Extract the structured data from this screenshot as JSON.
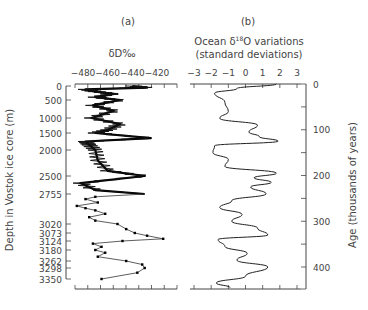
{
  "chart_data": [
    {
      "type": "line",
      "panel_label": "(a)",
      "title": "δD‰",
      "xlabel": "δD‰",
      "ylabel": "Depth in Vostok ice core (m)",
      "x_ticks": [
        "−480",
        "−460",
        "−440",
        "−420"
      ],
      "xlim": [
        -490,
        -410
      ],
      "y_ticks": [
        "0",
        "500",
        "1000",
        "1500",
        "2000",
        "2500",
        "2755",
        "3020",
        "3073",
        "3124",
        "3180",
        "3262",
        "3298",
        "3350"
      ],
      "y_inverted": true,
      "series": [
        {
          "name": "Vostok δD (continuous)",
          "depth": [
            0,
            60,
            120,
            200,
            280,
            400,
            500,
            650,
            800,
            1000,
            1200,
            1400,
            1500,
            1650,
            1750,
            1850,
            2000,
            2200,
            2400,
            2500,
            2600,
            2700,
            2755
          ],
          "values": [
            -440,
            -428,
            -478,
            -470,
            -455,
            -470,
            -450,
            -472,
            -455,
            -473,
            -450,
            -460,
            -470,
            -425,
            -478,
            -475,
            -470,
            -468,
            -460,
            -430,
            -482,
            -470,
            -430
          ]
        },
        {
          "name": "Vostok δD (deep, discrete points)",
          "depth": [
            2780,
            2800,
            2830,
            2860,
            2880,
            2900,
            2930,
            2960,
            2990,
            3020,
            3050,
            3073,
            3090,
            3110,
            3124,
            3140,
            3160,
            3180,
            3200,
            3230,
            3262,
            3280,
            3298,
            3320,
            3350
          ],
          "values": [
            -470,
            -478,
            -468,
            -485,
            -478,
            -470,
            -462,
            -475,
            -470,
            -452,
            -445,
            -438,
            -428,
            -415,
            -448,
            -472,
            -465,
            -470,
            -462,
            -468,
            -445,
            -432,
            -430,
            -436,
            -465
          ]
        }
      ]
    },
    {
      "type": "line",
      "panel_label": "(b)",
      "title": "Ocean δ18O variations (standard deviations)",
      "xlabel": "Ocean δ18O variations (standard deviations)",
      "ylabel": "Age (thousands of years)",
      "x_ticks": [
        "−3",
        "−2",
        "−1",
        "0",
        "1",
        "2",
        "3"
      ],
      "xlim": [
        -3,
        3
      ],
      "y_ticks": [
        "0",
        "100",
        "200",
        "300",
        "400"
      ],
      "ylim": [
        0,
        450
      ],
      "y_inverted": true,
      "series": [
        {
          "name": "Ocean δ18O",
          "age": [
            0,
            10,
            20,
            40,
            60,
            75,
            90,
            105,
            115,
            125,
            135,
            150,
            165,
            180,
            195,
            205,
            215,
            225,
            240,
            255,
            270,
            285,
            300,
            315,
            330,
            340,
            355,
            370,
            385,
            400,
            420,
            435,
            445
          ],
          "values": [
            1.8,
            -0.5,
            -1.8,
            -1.2,
            -1.0,
            -1.5,
            0.7,
            0.2,
            0.8,
            1.9,
            -1.8,
            -1.9,
            -1.0,
            -1.2,
            1.8,
            0.5,
            1.5,
            0.3,
            1.2,
            -0.8,
            -1.5,
            -0.2,
            -0.8,
            0.7,
            1.3,
            -1.6,
            -1.2,
            0.1,
            -0.5,
            1.3,
            0.0,
            -1.7,
            -0.9
          ]
        }
      ]
    }
  ],
  "labels": {
    "panel_a": "(a)",
    "panel_b": "(b)",
    "a_xlabel": "δD‰",
    "b_xlabel_line1": "Ocean δ",
    "b_xlabel_sup": "18",
    "b_xlabel_line1_end": "O variations",
    "b_xlabel_line2": "(standard deviations)",
    "a_ylabel": "Depth in Vostok ice core (m)",
    "b_ylabel": "Age (thousands of years)"
  }
}
